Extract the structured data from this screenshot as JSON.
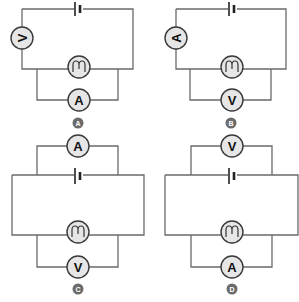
{
  "diagram": {
    "type": "circuit-diagrams",
    "colors": {
      "wire": "#6a6a6a",
      "meter_fill": "#e6e6e6",
      "meter_stroke": "#3a3a3a",
      "badge": "#6b6b6b"
    },
    "circuits": [
      {
        "id": "A",
        "label": "A",
        "side_meter": "V",
        "inner_meter": "A",
        "components": [
          "battery",
          "voltmeter (series, left side)",
          "lamp",
          "ammeter (parallel to lamp)"
        ]
      },
      {
        "id": "B",
        "label": "B",
        "side_meter": "A",
        "inner_meter": "V",
        "components": [
          "battery",
          "ammeter (series, left side)",
          "lamp",
          "voltmeter (parallel to lamp)"
        ]
      },
      {
        "id": "C",
        "label": "C",
        "top_meter": "A",
        "bottom_meter": "V",
        "components": [
          "ammeter (parallel to battery)",
          "battery",
          "lamp",
          "voltmeter (parallel to lamp)"
        ]
      },
      {
        "id": "D",
        "label": "D",
        "top_meter": "V",
        "bottom_meter": "A",
        "components": [
          "voltmeter (parallel to battery)",
          "battery",
          "lamp",
          "ammeter (parallel to lamp)"
        ]
      }
    ]
  }
}
